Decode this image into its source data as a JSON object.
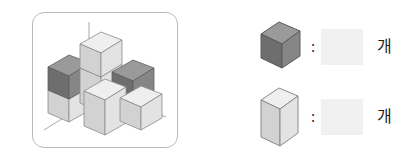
{
  "figure": {
    "panel_name": "cube-stack-figure",
    "axes": [
      {
        "name": "vertical-axis"
      },
      {
        "name": "left-axis"
      },
      {
        "name": "right-axis"
      }
    ],
    "colors": {
      "dark_top": "#9a9a9a",
      "dark_left": "#6e6e6e",
      "dark_right": "#858585",
      "light_top": "#efefef",
      "light_left": "#d3d3d3",
      "light_right": "#e2e2e2",
      "outline": "#6b6b6b",
      "panel_border": "#b9b9b9",
      "axis_line": "#a8a8a8",
      "blank_fill": "#f1f1f1"
    },
    "cubes": [
      {
        "name": "cube-left-bottom",
        "shade": "light"
      },
      {
        "name": "cube-left-top",
        "shade": "dark"
      },
      {
        "name": "cube-back-tall-lower",
        "shade": "light"
      },
      {
        "name": "cube-back-tall-upper",
        "shade": "light"
      },
      {
        "name": "cube-right-back",
        "shade": "dark"
      },
      {
        "name": "cube-center-front",
        "shade": "light"
      },
      {
        "name": "cube-right-front",
        "shade": "light"
      }
    ]
  },
  "legend": {
    "rows": [
      {
        "name": "legend-row-dark",
        "cube_label": "dark-cube-swatch",
        "colon": ":",
        "answer_value": "",
        "unit": "개"
      },
      {
        "name": "legend-row-light",
        "cube_label": "light-cube-swatch",
        "colon": ":",
        "answer_value": "",
        "unit": "개"
      }
    ]
  }
}
